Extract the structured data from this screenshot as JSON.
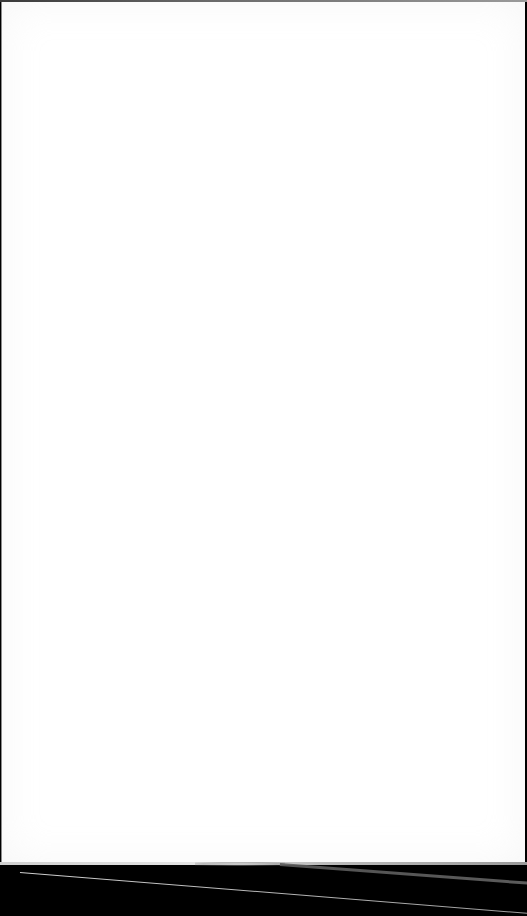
{
  "scene": {
    "description": "Overexposed photo of a blank white display",
    "screen_color": "#ffffff",
    "bezel_color": "#000000",
    "content": ""
  }
}
